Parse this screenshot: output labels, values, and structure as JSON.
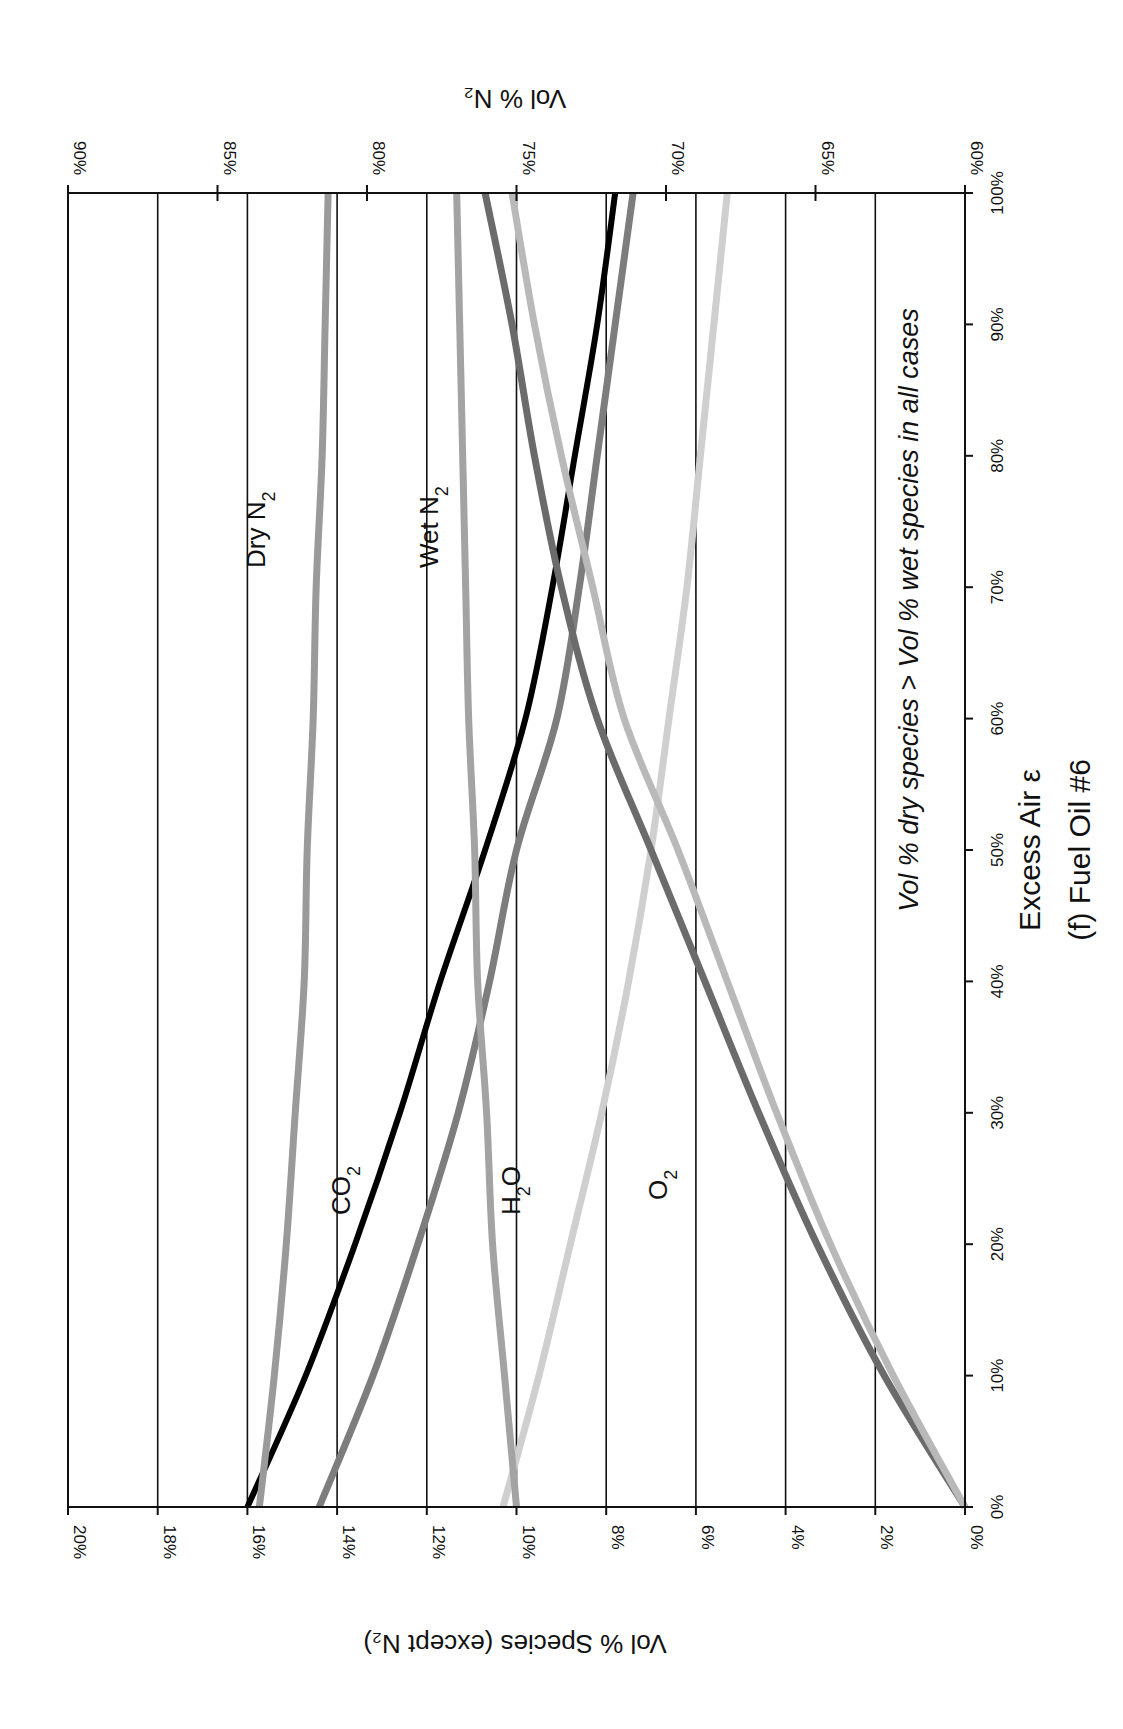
{
  "chart_data": {
    "type": "line",
    "orientation_note": "figure rotated 90 degrees",
    "title": "(f) Fuel Oil #6",
    "xlabel": "Excess Air ε",
    "ylabel": "Vol % Species (except N₂)",
    "y2label": "Vol % N₂",
    "annotation": "Vol % dry species > Vol % wet species in all cases",
    "x": [
      0,
      10,
      20,
      30,
      40,
      50,
      60,
      70,
      80,
      90,
      100
    ],
    "x_ticks": [
      "0%",
      "10%",
      "20%",
      "30%",
      "40%",
      "50%",
      "60%",
      "70%",
      "80%",
      "90%",
      "100%"
    ],
    "y_ticks": [
      "0%",
      "2%",
      "4%",
      "6%",
      "8%",
      "10%",
      "12%",
      "14%",
      "16%",
      "18%",
      "20%"
    ],
    "y2_ticks": [
      "60%",
      "65%",
      "70%",
      "75%",
      "80%",
      "85%",
      "90%"
    ],
    "xlim": [
      0,
      100
    ],
    "ylim": [
      0,
      20
    ],
    "y2lim": [
      60,
      90
    ],
    "grid": true,
    "series": [
      {
        "name": "CO2 (dry)",
        "axis": "y",
        "color": "#000000",
        "width": 6,
        "values": [
          16.0,
          14.7,
          13.6,
          12.6,
          11.7,
          10.7,
          9.8,
          9.2,
          8.7,
          8.2,
          7.8
        ]
      },
      {
        "name": "CO2 (wet)",
        "axis": "y",
        "color": "#7d7d7d",
        "width": 7,
        "values": [
          14.4,
          13.2,
          12.2,
          11.3,
          10.6,
          10.0,
          9.1,
          8.6,
          8.2,
          7.8,
          7.4
        ]
      },
      {
        "name": "H2O",
        "axis": "y",
        "color": "#cfcfcf",
        "width": 7,
        "values": [
          10.3,
          9.5,
          8.8,
          8.1,
          7.5,
          7.0,
          6.6,
          6.2,
          5.9,
          5.6,
          5.3
        ]
      },
      {
        "name": "O2 (dry)",
        "axis": "y",
        "color": "#6b6b6b",
        "width": 7,
        "values": [
          0,
          1.8,
          3.3,
          4.6,
          5.8,
          7.0,
          8.2,
          9.0,
          9.6,
          10.1,
          10.7
        ]
      },
      {
        "name": "O2 (wet)",
        "axis": "y",
        "color": "#b9b9b9",
        "width": 7,
        "values": [
          0,
          1.6,
          3.0,
          4.2,
          5.3,
          6.4,
          7.6,
          8.3,
          9.0,
          9.6,
          10.1
        ]
      },
      {
        "name": "Dry N2",
        "axis": "y2",
        "color": "#9a9a9a",
        "width": 7,
        "values": [
          83.6,
          83.1,
          82.7,
          82.4,
          82.1,
          82.0,
          81.8,
          81.7,
          81.5,
          81.4,
          81.3
        ]
      },
      {
        "name": "Wet N2",
        "axis": "y2",
        "color": "#a3a3a3",
        "width": 7,
        "values": [
          75.0,
          75.4,
          75.8,
          76.0,
          76.3,
          76.4,
          76.6,
          76.7,
          76.8,
          76.9,
          77.0
        ]
      }
    ],
    "curve_labels": {
      "co2": {
        "main": "CO",
        "sub": "2"
      },
      "h2o": {
        "main": "H",
        "sub": "2",
        "tail": "O"
      },
      "o2": {
        "main": "O",
        "sub": "2"
      },
      "dry_n2": {
        "main": "Dry N",
        "sub": "2"
      },
      "wet_n2": {
        "main": "Wet N",
        "sub": "2"
      }
    }
  }
}
